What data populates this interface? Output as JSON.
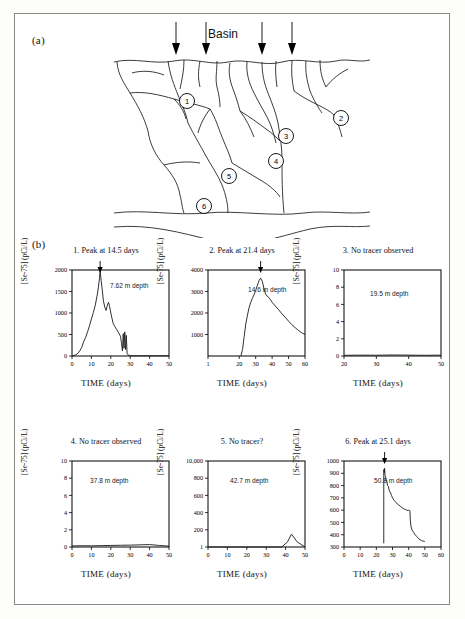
{
  "figure": {
    "panel_a_label": "(a)",
    "panel_b_label": "(b)",
    "basin_label": "Basin",
    "diagram_nodes": [
      "1",
      "2",
      "3",
      "4",
      "5",
      "6"
    ]
  },
  "chart_data": [
    {
      "type": "line",
      "id": 1,
      "title": "1.  Peak at 14.5 days",
      "annotation": "7.62 m depth",
      "xlabel": "TIME (days)",
      "ylabel": "[Se-75] (pCi/L)",
      "xlim": [
        0,
        50
      ],
      "ylim": [
        0,
        2000
      ],
      "xticks": [
        0,
        10,
        20,
        30,
        40,
        50
      ],
      "yticks": [
        0,
        500,
        1000,
        1500,
        2000
      ],
      "peak_marker_x": 14.5,
      "x": [
        0,
        1,
        2,
        3,
        4,
        5,
        6,
        7,
        8,
        9,
        10,
        11,
        12,
        13,
        13.6,
        14.2,
        14.5,
        15,
        15.6,
        16.2,
        17,
        17.6,
        18.2,
        18.8,
        19.4,
        20,
        20.6,
        21.2,
        22,
        23,
        24,
        25,
        25.5,
        26,
        26.4,
        26.8,
        27.2,
        27.6,
        28,
        28.4,
        29,
        30,
        31,
        33,
        36,
        40,
        45,
        50
      ],
      "y": [
        0,
        10,
        30,
        60,
        120,
        200,
        330,
        430,
        560,
        700,
        860,
        1010,
        1180,
        1420,
        1600,
        1820,
        1980,
        1760,
        1540,
        1280,
        1120,
        1060,
        1180,
        1250,
        1150,
        1000,
        880,
        760,
        690,
        620,
        540,
        460,
        300,
        120,
        520,
        180,
        560,
        150,
        480,
        60,
        20,
        10,
        5,
        5,
        5,
        5,
        5,
        5
      ]
    },
    {
      "type": "line",
      "id": 2,
      "title": "2.  Peak at 21.4 days",
      "annotation": "14.6 m depth",
      "xlabel": "TIME (days)",
      "ylabel": "[Se-75] (pCi/L)",
      "xlim": [
        1,
        60
      ],
      "ylim": [
        0,
        4000
      ],
      "xticks": [
        1,
        20,
        30,
        40,
        50,
        60
      ],
      "yticks": [
        1000,
        2000,
        3000,
        4000
      ],
      "peak_marker_x": 33,
      "x": [
        21,
        22,
        23,
        24,
        25,
        26,
        27,
        28,
        29,
        30,
        31,
        32,
        33,
        34,
        35,
        36,
        37,
        38,
        39,
        40,
        42,
        44,
        46,
        48,
        50,
        52,
        54,
        56,
        58,
        60
      ],
      "y": [
        0,
        300,
        900,
        1500,
        1900,
        2250,
        2500,
        2680,
        2850,
        3050,
        3280,
        3500,
        3620,
        3480,
        3150,
        2880,
        2780,
        2720,
        2620,
        2500,
        2320,
        2150,
        1960,
        1800,
        1620,
        1460,
        1320,
        1190,
        1080,
        1000
      ]
    },
    {
      "type": "line",
      "id": 3,
      "title": "3.  No tracer observed",
      "annotation": "19.5 m depth",
      "xlabel": "TIME (days)",
      "ylabel": "[Se-75] (pCi/L)",
      "xlim": [
        20,
        50
      ],
      "ylim": [
        0,
        10
      ],
      "xticks": [
        20,
        30,
        40,
        50
      ],
      "yticks": [
        0,
        2,
        4,
        6,
        8,
        10
      ],
      "peak_marker_x": null,
      "x": [
        20,
        25,
        30,
        35,
        40,
        45,
        50
      ],
      "y": [
        0.08,
        0.1,
        0.09,
        0.12,
        0.1,
        0.08,
        0.1
      ]
    },
    {
      "type": "line",
      "id": 4,
      "title": "4.  No tracer observed",
      "annotation": "37.8 m depth",
      "xlabel": "TIME (days)",
      "ylabel": "[Se-75] (pCi/L)",
      "xlim": [
        0,
        50
      ],
      "ylim": [
        0,
        10
      ],
      "xticks": [
        0,
        10,
        20,
        30,
        40,
        50
      ],
      "yticks": [
        0,
        2,
        4,
        6,
        8,
        10
      ],
      "peak_marker_x": null,
      "x": [
        0,
        5,
        10,
        15,
        20,
        25,
        30,
        35,
        40,
        45,
        50
      ],
      "y": [
        0.12,
        0.15,
        0.14,
        0.16,
        0.18,
        0.2,
        0.22,
        0.25,
        0.28,
        0.18,
        0.1
      ]
    },
    {
      "type": "line",
      "id": 5,
      "title": "5.  No tracer?",
      "annotation": "42.7 m depth",
      "xlabel": "TIME (days)",
      "ylabel": "[Se-75] (pCi/L)",
      "xlim": [
        0,
        50
      ],
      "ylim": [
        1,
        1000
      ],
      "xticks": [
        0,
        10,
        20,
        30,
        40,
        50
      ],
      "yticks": [
        1,
        200,
        400,
        600,
        800,
        10000
      ],
      "ytick_labels": [
        "1",
        "200",
        "400",
        "600",
        "800",
        "10,000"
      ],
      "peak_marker_x": null,
      "x": [
        0,
        10,
        20,
        30,
        38,
        41,
        43,
        46,
        50
      ],
      "y": [
        1,
        1,
        1,
        1,
        1,
        60,
        150,
        60,
        1
      ]
    },
    {
      "type": "line",
      "id": 6,
      "title": "6.  Peak at 25.1 days",
      "annotation": "50.8 m depth",
      "xlabel": "TIME (days)",
      "ylabel": "[Se-75] (pCi/L)",
      "xlim": [
        0,
        60
      ],
      "ylim": [
        300,
        1000
      ],
      "xticks": [
        0,
        10,
        20,
        30,
        40,
        50,
        60
      ],
      "yticks": [
        300,
        400,
        500,
        600,
        700,
        800,
        900,
        1000
      ],
      "peak_marker_x": 25.1,
      "x": [
        24.6,
        24.6,
        25,
        25.1,
        25.4,
        25.7,
        26,
        26.3,
        26.7,
        27,
        27.4,
        27.8,
        28.2,
        28.8,
        29.4,
        30,
        31,
        32,
        33,
        34,
        35,
        36,
        37,
        38,
        39,
        39.6,
        40,
        40.4,
        40.8,
        41,
        41.4,
        42,
        43,
        44,
        45,
        46,
        47,
        48,
        49,
        50
      ],
      "y": [
        330,
        930,
        905,
        940,
        880,
        870,
        840,
        845,
        820,
        800,
        795,
        770,
        755,
        740,
        720,
        700,
        680,
        665,
        650,
        640,
        630,
        620,
        610,
        605,
        600,
        595,
        600,
        598,
        595,
        520,
        470,
        440,
        420,
        400,
        385,
        370,
        360,
        352,
        348,
        345
      ]
    }
  ]
}
